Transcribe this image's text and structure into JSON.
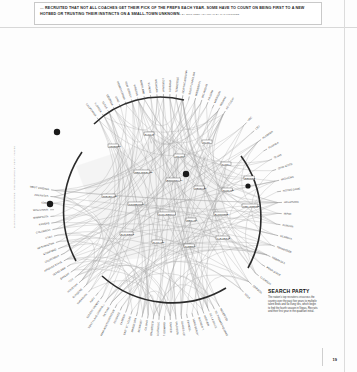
{
  "header": {
    "headline_line1": "… RECRUITED THAT NOT ALL COACHES GET THEIR PICK OF THE PREPS EACH YEAR. SOME HAVE TO COUNT ON BEING FIRST",
    "headline_line2": "TO A NEW HOTBED OR TRUSTING THEIR INSTINCTS ON A SMALL-TOWN UNKNOWN.",
    "byline": "BY ERIC NEEL | DIAGRAM BY CATALOGTREE"
  },
  "side_credit": "DIAGRAM BY CATALOGTREE · PHOTOGRAPHS BY GETTY IMAGES",
  "caption": {
    "title": "SEARCH PARTY",
    "body": "The nation’s top recruiters crisscross the country over the past five years to multiple talent beds and far-flung ties, which begin to find the fourth season in Vegas, Recruits and their first year in the quadrant initial."
  },
  "folio": {
    "page_number": "19"
  },
  "chart_data": {
    "type": "network",
    "title": "SEARCH PARTY",
    "layout": "radial arcs around a central hub with curved edges",
    "arcs": [
      {
        "name": "top-arc",
        "position": "top",
        "label_count": 22,
        "labels": [
          "CALIFORNIA",
          "FLORIDA",
          "TEXAS",
          "GEORGIA",
          "OHIO",
          "PENNSYLVANIA",
          "NEW JERSEY",
          "VIRGINIA",
          "MARYLAND",
          "ILLINOIS",
          "MICHIGAN",
          "LOUISIANA",
          "ALABAMA",
          "TENNESSEE",
          "NORTH CAROLINA",
          "SOUTH CAROLINA",
          "MISSISSIPPI",
          "OKLAHOMA",
          "ARIZONA",
          "MISSOURI",
          "INDIANA",
          "KENTUCKY"
        ]
      },
      {
        "name": "right-arc",
        "position": "right",
        "label_count": 18,
        "labels": [
          "USC",
          "LSU",
          "ALABAMA",
          "FLORIDA",
          "TEXAS",
          "OHIO STATE",
          "MICHIGAN",
          "NOTRE DAME",
          "OKLAHOMA",
          "MIAMI",
          "AUBURN",
          "GEORGIA",
          "TENNESSEE",
          "NEBRASKA",
          "PENN STATE",
          "CLEMSON",
          "OREGON",
          "UCLA"
        ]
      },
      {
        "name": "left-arc",
        "position": "left",
        "label_count": 18,
        "labels": [
          "WEST VIRGINIA",
          "ARKANSAS",
          "IOWA",
          "WISCONSIN",
          "MINNESOTA",
          "KANSAS",
          "COLORADO",
          "UTAH",
          "WASHINGTON",
          "STANFORD",
          "CALIFORNIA",
          "ARIZONA STATE",
          "TEXAS A&M",
          "BAYLOR",
          "TCU",
          "HOUSTON",
          "RUTGERS",
          "SYRACUSE"
        ]
      },
      {
        "name": "bottom-arc",
        "position": "bottom",
        "label_count": 24,
        "labels": [
          "MATER DEI",
          "ST. THOMAS AQUINAS",
          "DE LA SALLE",
          "HOOVER",
          "BOOKER T.",
          "LONG BEACH POLY",
          "EVANGEL",
          "GLADES CENTRAL",
          "VALDOSTA",
          "CARVER",
          "ST. EDWARD",
          "BERGEN CATHOLIC",
          "DON BOSCO",
          "GILMAN",
          "MCKINLEY",
          "MASSILLON",
          "EAST ST. LOUIS",
          "CAMDEN",
          "PAHOKEE",
          "MIAMI NORTHWESTERN",
          "SKYLINE",
          "SOUTHLAKE CARROLL",
          "EULESS TRINITY",
          "KATY"
        ]
      }
    ],
    "hub_nodes": [
      "HOUSTON",
      "DALLAS",
      "ATLANTA",
      "MIAMI",
      "TAMPA",
      "NEW ORLEANS",
      "BIRMINGHAM",
      "MEMPHIS",
      "CHICAGO",
      "DETROIT",
      "CLEVELAND",
      "PITTSBURGH",
      "PHILADELPHIA",
      "NEWARK",
      "BALTIMORE",
      "LOS ANGELES",
      "SAN DIEGO",
      "OAKLAND",
      "PHOENIX",
      "LAS VEGAS"
    ],
    "edge_count": 180,
    "grid": false,
    "legend": null
  }
}
